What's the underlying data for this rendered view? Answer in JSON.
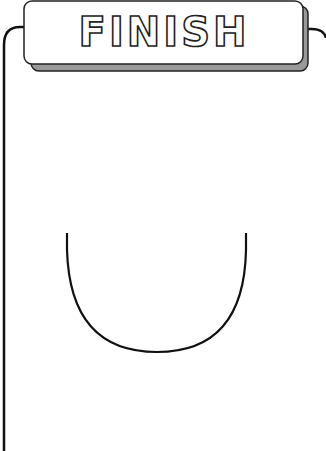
{
  "banner": {
    "title": "FINISH",
    "fill_color": "#ffffff",
    "shadow_color": "#999999",
    "stroke_color": "#222222"
  },
  "shapes": {
    "u_curve": {
      "left_x": 67,
      "right_x": 246,
      "top_y": 233,
      "bottom_y": 352
    }
  }
}
